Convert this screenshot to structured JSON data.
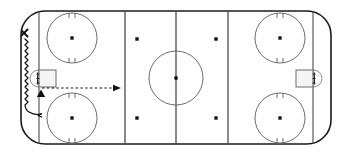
{
  "diagram": {
    "surface_color": "#ffffff",
    "line_color": "#4a4a52",
    "mark_color": "#111115",
    "border_color": "#1b1b1b"
  },
  "rink": {
    "outline": {
      "name": "rink-boundary",
      "x": 21,
      "y": 11,
      "width": 310,
      "height": 133,
      "corner_radius": 24
    },
    "zone_lines": [
      {
        "name": "left-goal-line",
        "label": "Goal Line",
        "x": 39
      },
      {
        "name": "left-blue-line",
        "label": "Blue Line",
        "x": 125
      },
      {
        "name": "center-red-line",
        "label": "Center Line",
        "x": 176
      },
      {
        "name": "right-blue-line",
        "label": "Blue Line",
        "x": 228
      },
      {
        "name": "right-goal-line",
        "label": "Goal Line",
        "x": 313
      }
    ],
    "center_circle": {
      "name": "center-ice-circle",
      "cx": 176,
      "cy": 78,
      "r": 27
    },
    "end_zone_circles": [
      {
        "name": "faceoff-circle-left-top",
        "cx": 72,
        "cy": 38,
        "r": 25
      },
      {
        "name": "faceoff-circle-left-bottom",
        "cx": 72,
        "cy": 118,
        "r": 25
      },
      {
        "name": "faceoff-circle-right-top",
        "cx": 280,
        "cy": 38,
        "r": 25
      },
      {
        "name": "faceoff-circle-right-bottom",
        "cx": 280,
        "cy": 118,
        "r": 25
      }
    ],
    "neutral_zone_dots": [
      {
        "name": "neutral-dot-left-top",
        "cx": 137,
        "cy": 39
      },
      {
        "name": "neutral-dot-right-top",
        "cx": 216,
        "cy": 39
      },
      {
        "name": "neutral-dot-left-bottom",
        "cx": 137,
        "cy": 118
      },
      {
        "name": "neutral-dot-right-bottom",
        "cx": 216,
        "cy": 118
      }
    ],
    "goals": [
      {
        "name": "goal-net-left",
        "x": 39,
        "y": 70,
        "width": 17,
        "height": 17,
        "side": "left"
      },
      {
        "name": "goal-net-right",
        "x": 296,
        "y": 70,
        "width": 17,
        "height": 17,
        "side": "right"
      }
    ]
  },
  "annotations": {
    "player_marker": {
      "name": "player-marker-x",
      "symbol": "X",
      "cx": 24,
      "cy": 33,
      "size": 5
    },
    "target_marker": {
      "name": "target-marker-triangle",
      "symbol": "triangle",
      "cx": 41,
      "cy": 94,
      "size": 5
    },
    "skating_route": {
      "name": "skating-route-path",
      "style": "zigzag",
      "description": "Player skates from corner down along boards and behind the net"
    },
    "pass_route": {
      "name": "pass-route-path",
      "style": "dashed-arrow",
      "start_x": 41,
      "start_y": 88,
      "end_x": 119,
      "end_y": 88,
      "description": "Pass from behind the net out to the blue line"
    }
  }
}
